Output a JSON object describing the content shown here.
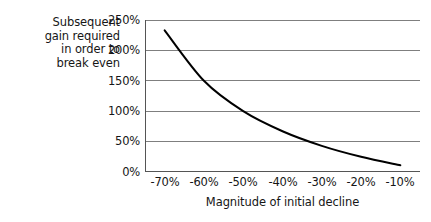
{
  "chart_data": {
    "type": "line",
    "title": "",
    "xlabel": "Magnitude of initial decline",
    "ylabel": "Subsequent gain required in order to break even",
    "ylabel_lines": [
      "Subsequent",
      "gain required",
      "in order to",
      "break even"
    ],
    "x": [
      -70,
      -60,
      -50,
      -40,
      -30,
      -20,
      -10
    ],
    "values": [
      233,
      150,
      100,
      67,
      43,
      25,
      11
    ],
    "categories": [
      "-70%",
      "-60%",
      "-50%",
      "-40%",
      "-30%",
      "-20%",
      "-10%"
    ],
    "xtick_labels": [
      "-70%",
      "-60%",
      "-50%",
      "-40%",
      "-30%",
      "-20%",
      "-10%"
    ],
    "ytick_labels": [
      "250%",
      "200%",
      "150%",
      "100%",
      "50%",
      "0%"
    ],
    "ytick_values": [
      250,
      200,
      150,
      100,
      50,
      0
    ],
    "ylim": [
      0,
      250
    ],
    "xlim": [
      -75,
      -5
    ],
    "grid": "horizontal",
    "legend": "none",
    "series": [
      {
        "name": "Gain required to break even",
        "values": [
          233,
          150,
          100,
          67,
          43,
          25,
          11
        ]
      }
    ],
    "colors": {
      "line": "#000000",
      "gridline": "#7f7f7f",
      "axis": "#555555",
      "text": "#161616",
      "background": "#ffffff"
    }
  }
}
